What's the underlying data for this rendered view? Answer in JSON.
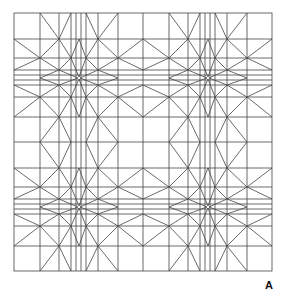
{
  "figure": {
    "panel_label": "A",
    "line_color": "#444444",
    "background_color": "#ffffff",
    "outer_square": {
      "x": 14,
      "y": 13,
      "size": 258
    },
    "tile_grid": {
      "rows": 2,
      "cols": 2,
      "tile_size": 129
    },
    "tile_grid_lines_local": [
      26,
      45,
      57,
      62,
      67,
      72,
      84,
      104
    ]
  }
}
